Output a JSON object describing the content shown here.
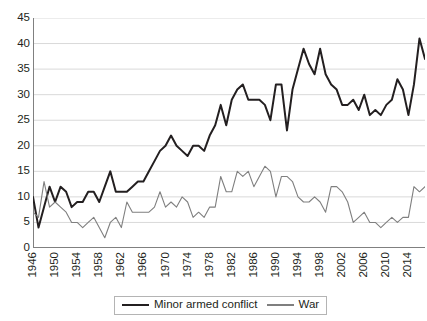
{
  "chart_data": {
    "type": "line",
    "title": "",
    "subtitle": "",
    "xlabel": "",
    "ylabel": "",
    "xlim": [
      1946,
      2017
    ],
    "ylim": [
      0,
      45
    ],
    "y_ticks": [
      0,
      5,
      10,
      15,
      20,
      25,
      30,
      35,
      40,
      45
    ],
    "x_tick_labels": [
      "1946",
      "1950",
      "1954",
      "1958",
      "1962",
      "1966",
      "1970",
      "1974",
      "1978",
      "1982",
      "1986",
      "1990",
      "1994",
      "1998",
      "2002",
      "2006",
      "2010",
      "2014"
    ],
    "x_tick_years": [
      1946,
      1950,
      1954,
      1958,
      1962,
      1966,
      1970,
      1974,
      1978,
      1982,
      1986,
      1990,
      1994,
      1998,
      2002,
      2006,
      2010,
      2014
    ],
    "x_minor_tick_step": 1,
    "grid": "horizontal",
    "legend_position": "bottom",
    "x": [
      1946,
      1947,
      1948,
      1949,
      1950,
      1951,
      1952,
      1953,
      1954,
      1955,
      1956,
      1957,
      1958,
      1959,
      1960,
      1961,
      1962,
      1963,
      1964,
      1965,
      1966,
      1967,
      1968,
      1969,
      1970,
      1971,
      1972,
      1973,
      1974,
      1975,
      1976,
      1977,
      1978,
      1979,
      1980,
      1981,
      1982,
      1983,
      1984,
      1985,
      1986,
      1987,
      1988,
      1989,
      1990,
      1991,
      1992,
      1993,
      1994,
      1995,
      1996,
      1997,
      1998,
      1999,
      2000,
      2001,
      2002,
      2003,
      2004,
      2005,
      2006,
      2007,
      2008,
      2009,
      2010,
      2011,
      2012,
      2013,
      2014,
      2015
    ],
    "series": [
      {
        "name": "Minor armed conflict",
        "color": "#231f20",
        "width": 2.0,
        "values": [
          10,
          4,
          8,
          12,
          9,
          12,
          11,
          8,
          9,
          9,
          11,
          11,
          9,
          12,
          15,
          11,
          11,
          11,
          12,
          13,
          13,
          15,
          17,
          19,
          20,
          22,
          20,
          19,
          18,
          20,
          20,
          19,
          22,
          24,
          28,
          24,
          29,
          31,
          32,
          29,
          29,
          29,
          28,
          25,
          32,
          32,
          23,
          31,
          35,
          39,
          36,
          34,
          39,
          34,
          32,
          31,
          28,
          28,
          29,
          27,
          30,
          26,
          27,
          26,
          28,
          29,
          33,
          31,
          26,
          32
        ]
      },
      {
        "name": "War",
        "color": "#7f7f7f",
        "width": 1.1,
        "values": [
          7,
          6,
          13,
          8,
          9,
          8,
          7,
          5,
          5,
          4,
          5,
          6,
          4,
          2,
          5,
          6,
          4,
          9,
          7,
          7,
          7,
          7,
          8,
          11,
          8,
          9,
          8,
          10,
          9,
          6,
          7,
          6,
          8,
          8,
          14,
          11,
          11,
          15,
          14,
          15,
          12,
          14,
          16,
          15,
          10,
          14,
          14,
          13,
          10,
          9,
          9,
          10,
          9,
          7,
          12,
          12,
          11,
          9,
          5,
          6,
          7,
          5,
          5,
          4,
          5,
          6,
          5,
          6,
          6,
          12
        ]
      }
    ],
    "end_points": {
      "minor_final_label": "37",
      "minor_peak_label": "41",
      "war_final_label": "12"
    },
    "extra_points": {
      "minor_2016": 41,
      "minor_2017": 37,
      "war_2016": 11,
      "war_2017": 12
    }
  },
  "legend": {
    "entries": [
      {
        "label": "Minor armed conflict",
        "color": "#231f20"
      },
      {
        "label": "War",
        "color": "#7f7f7f"
      }
    ]
  },
  "colors": {
    "minor": "#231f20",
    "war": "#7f7f7f",
    "grid": "#d9d9d9",
    "axis": "#808080",
    "text": "#231f20"
  }
}
